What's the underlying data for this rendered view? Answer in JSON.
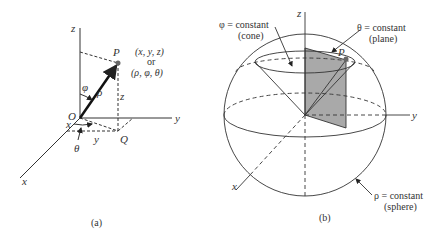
{
  "panel_a": {
    "caption": "(a)",
    "axis_z": "z",
    "axis_y": "y",
    "axis_x": "x",
    "origin": "O",
    "point_p": "P",
    "point_q": "Q",
    "coords_cartesian": "(x, y, z)",
    "or_label": "or",
    "coords_spherical": "(ρ, φ, θ)",
    "rho": "ρ",
    "phi": "φ",
    "theta": "θ",
    "z_height": "z",
    "x_proj": "x",
    "y_proj": "y"
  },
  "panel_b": {
    "caption": "(b)",
    "axis_z": "z",
    "axis_y": "y",
    "axis_x": "x",
    "point_p": "P",
    "cone_label_1": "φ = constant",
    "cone_label_2": "(cone)",
    "plane_label_1": "θ = constant",
    "plane_label_2": "(plane)",
    "sphere_label_1": "ρ = constant",
    "sphere_label_2": "(sphere)"
  },
  "colors": {
    "line": "#333333",
    "plane_fill": "#a9a9a9",
    "point": "#666666"
  }
}
